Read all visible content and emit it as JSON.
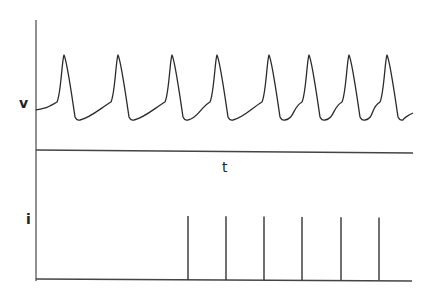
{
  "chart_data": {
    "type": "line",
    "title": "",
    "panels": [
      {
        "name": "voltage",
        "ylabel": "v",
        "xlabel": "t",
        "description": "Periodic action-potential-like oscillation (8 spikes)",
        "spike_times_px": [
          64,
          118,
          172,
          217,
          269,
          309,
          349,
          387
        ],
        "peak_y_px": 55,
        "trough_y_px": 120,
        "baseline_start_y_px": 110
      },
      {
        "name": "current",
        "ylabel": "i",
        "xlabel": "",
        "description": "Impulse train of current pulses starting mid-trace (6 pulses)",
        "pulse_times_px": [
          188,
          226,
          264,
          302,
          341,
          379
        ],
        "pulse_top_y_px": 216,
        "baseline_y_px": 280
      }
    ],
    "grid": false,
    "legend": null
  },
  "labels": {
    "v_axis": "v",
    "t_axis": "t",
    "i_axis": "i"
  },
  "colors": {
    "trace": "#2a2a2a",
    "axis": "#444444",
    "background": "#ffffff"
  }
}
